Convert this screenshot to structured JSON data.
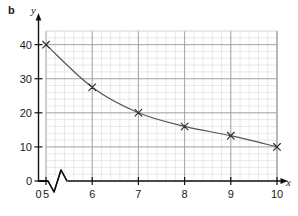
{
  "figure": {
    "part_label": "b",
    "x_axis_name": "x",
    "y_axis_name": "y"
  },
  "chart_data": {
    "type": "line",
    "title": "",
    "subtitle": "",
    "xlabel": "x",
    "ylabel": "y",
    "x": [
      5,
      6,
      7,
      8,
      9,
      10
    ],
    "values": [
      40,
      27.5,
      20,
      16,
      13.3,
      10
    ],
    "series": [
      {
        "name": "curve",
        "x": [
          5,
          6,
          7,
          8,
          9,
          10
        ],
        "values": [
          40,
          27.5,
          20,
          16,
          13.3,
          10
        ],
        "marker": "x",
        "color": "#555555"
      }
    ],
    "xlim": [
      0,
      10
    ],
    "ylim": [
      0,
      44
    ],
    "x_ticks": [
      0,
      5,
      6,
      7,
      8,
      9,
      10
    ],
    "x_tick_labels": [
      "0",
      "5",
      "6",
      "7",
      "8",
      "9",
      "10"
    ],
    "y_ticks": [
      0,
      10,
      20,
      30,
      40
    ],
    "y_tick_labels": [
      "0",
      "10",
      "20",
      "30",
      "40"
    ],
    "x_minor_per_major": 5,
    "y_minor_step": 2,
    "grid": true,
    "grid_color_major": "#9aa0a6",
    "grid_color_minor": "#d8dadd",
    "axis_color": "#111111",
    "axis_break_x": true,
    "legend": "none",
    "annotations": []
  }
}
